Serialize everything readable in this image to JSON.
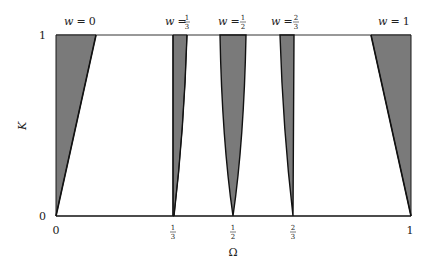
{
  "diagram": {
    "type": "tongue-regions",
    "x_axis": {
      "label": "Ω",
      "ticks": [
        {
          "value": 0,
          "text": "0"
        },
        {
          "value": 0.3333,
          "num": "1",
          "den": "3"
        },
        {
          "value": 0.5,
          "num": "1",
          "den": "2"
        },
        {
          "value": 0.6667,
          "num": "2",
          "den": "3"
        },
        {
          "value": 1,
          "text": "1"
        }
      ]
    },
    "y_axis": {
      "label": "K",
      "ticks": [
        {
          "value": 0,
          "text": "0"
        },
        {
          "value": 1,
          "text": "1"
        }
      ]
    },
    "tongues": [
      {
        "label_var": "w",
        "label_eq": "=",
        "label_text": "0",
        "omega": 0
      },
      {
        "label_var": "w",
        "label_eq": "=",
        "num": "1",
        "den": "3",
        "omega": 0.3333
      },
      {
        "label_var": "w",
        "label_eq": "=",
        "num": "1",
        "den": "2",
        "omega": 0.5
      },
      {
        "label_var": "w",
        "label_eq": "=",
        "num": "2",
        "den": "3",
        "omega": 0.6667
      },
      {
        "label_var": "w",
        "label_eq": "=",
        "label_text": "1",
        "omega": 1
      }
    ],
    "colors": {
      "tongue_fill": "#7a7a7a",
      "outline": "#1a1a1a",
      "frame": "#333333"
    }
  }
}
